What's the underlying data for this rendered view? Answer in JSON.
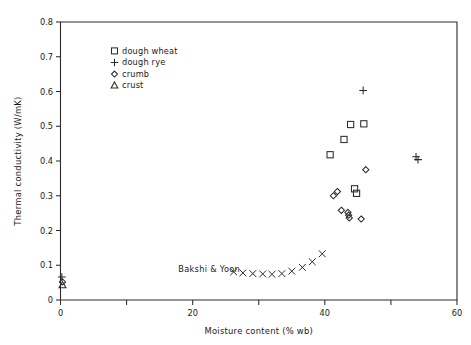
{
  "chart_data": {
    "type": "scatter",
    "title": "",
    "xlabel": "Moisture content (% wb)",
    "ylabel": "Thermal conductivity (W/mK)",
    "xlim": [
      0,
      60
    ],
    "ylim": [
      0,
      0.8
    ],
    "xticks": [
      0,
      20,
      40,
      60
    ],
    "xtick_labels": [
      "0",
      "20",
      "40",
      "60"
    ],
    "xticks_minor": [
      10,
      30,
      50
    ],
    "yticks": [
      0,
      0.1,
      0.2,
      0.3,
      0.4,
      0.5,
      0.6,
      0.7,
      0.8
    ],
    "ytick_labels": [
      "0",
      "0.1",
      "0.2",
      "0.3",
      "0.4",
      "0.5",
      "0.6",
      "0.7",
      "0.8"
    ],
    "grid": false,
    "legend_position": "upper-left-inside",
    "annotations": [
      {
        "text": "Bakshi & Yoon",
        "x": 22.5,
        "y": 0.082
      }
    ],
    "series": [
      {
        "name": "dough wheat",
        "marker": "square",
        "points": [
          {
            "x": 40.8,
            "y": 0.418
          },
          {
            "x": 42.9,
            "y": 0.462
          },
          {
            "x": 43.9,
            "y": 0.505
          },
          {
            "x": 45.9,
            "y": 0.507
          },
          {
            "x": 44.5,
            "y": 0.32
          },
          {
            "x": 44.8,
            "y": 0.307
          }
        ]
      },
      {
        "name": "dough rye",
        "marker": "plus",
        "points": [
          {
            "x": 45.8,
            "y": 0.603
          },
          {
            "x": 53.8,
            "y": 0.412
          },
          {
            "x": 54.1,
            "y": 0.404
          },
          {
            "x": 0.2,
            "y": 0.066
          }
        ]
      },
      {
        "name": "crumb",
        "marker": "diamond",
        "points": [
          {
            "x": 41.3,
            "y": 0.3
          },
          {
            "x": 41.9,
            "y": 0.312
          },
          {
            "x": 46.2,
            "y": 0.375
          },
          {
            "x": 42.5,
            "y": 0.258
          },
          {
            "x": 43.5,
            "y": 0.252
          },
          {
            "x": 43.6,
            "y": 0.244
          },
          {
            "x": 43.7,
            "y": 0.236
          },
          {
            "x": 45.5,
            "y": 0.233
          },
          {
            "x": 0.3,
            "y": 0.052
          }
        ]
      },
      {
        "name": "crust",
        "marker": "triangle",
        "points": [
          {
            "x": 0.3,
            "y": 0.042
          }
        ]
      },
      {
        "name": "Bakshi & Yoon",
        "marker": "cross",
        "points": [
          {
            "x": 26.2,
            "y": 0.081
          },
          {
            "x": 27.6,
            "y": 0.078
          },
          {
            "x": 29.1,
            "y": 0.076
          },
          {
            "x": 30.6,
            "y": 0.075
          },
          {
            "x": 32.0,
            "y": 0.074
          },
          {
            "x": 33.5,
            "y": 0.076
          },
          {
            "x": 35.0,
            "y": 0.083
          },
          {
            "x": 36.6,
            "y": 0.094
          },
          {
            "x": 38.1,
            "y": 0.11
          },
          {
            "x": 39.6,
            "y": 0.133
          }
        ]
      }
    ]
  },
  "legend": {
    "items": [
      {
        "label": "dough wheat",
        "marker": "square"
      },
      {
        "label": "dough rye",
        "marker": "plus"
      },
      {
        "label": "crumb",
        "marker": "diamond"
      },
      {
        "label": "crust",
        "marker": "triangle"
      }
    ]
  }
}
